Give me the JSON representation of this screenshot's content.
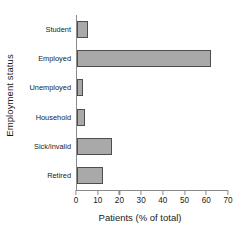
{
  "chart_data": {
    "type": "bar",
    "orientation": "horizontal",
    "title": "",
    "xlabel": "Patients (% of total)",
    "ylabel": "Employment status",
    "categories": [
      "Student",
      "Employed",
      "Unemployed",
      "Household",
      "Sick/invalid",
      "Retired"
    ],
    "values": [
      5,
      61.5,
      2.8,
      3.7,
      16,
      12
    ],
    "xlim": [
      0,
      70
    ],
    "xticks": [
      0,
      10,
      20,
      30,
      40,
      50,
      60,
      70
    ],
    "xtick_labels": [
      "0",
      "10",
      "20",
      "30",
      "40",
      "50",
      "60",
      "70"
    ],
    "grid": false,
    "legend": false,
    "bar_fill_color": "#a9a9a9",
    "bar_edge_color": "#4d4d4d",
    "axis_color": "#8a8a8a"
  }
}
